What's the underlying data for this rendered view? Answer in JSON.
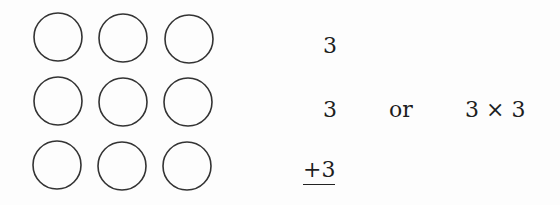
{
  "figure": {
    "grid": {
      "rows": 3,
      "cols": 3,
      "shape": "circle",
      "count": 9
    },
    "addition": {
      "lines": [
        "3",
        "3",
        "+3"
      ]
    },
    "connector": "or",
    "multiplication": "3 × 3"
  }
}
